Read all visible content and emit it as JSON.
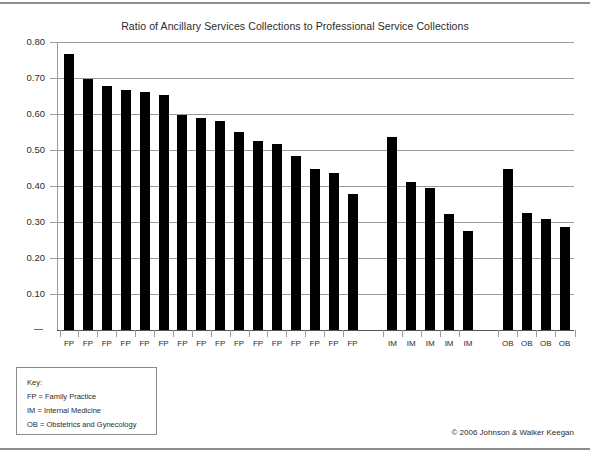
{
  "chart_data": {
    "type": "bar",
    "title": "Ratio of Ancillary Services Collections to Professional Service Collections",
    "xlabel": "",
    "ylabel": "",
    "ylim": [
      0,
      0.8
    ],
    "ytick_labels": [
      "0.80",
      "0.70",
      "0.60",
      "0.50",
      "0.40",
      "0.30",
      "0.20",
      "0.10",
      "–"
    ],
    "ytick_values": [
      0.8,
      0.7,
      0.6,
      0.5,
      0.4,
      0.3,
      0.2,
      0.1,
      0
    ],
    "grid": true,
    "legend_position": "below-left",
    "groups": [
      {
        "code": "FP",
        "name": "Family Practice"
      },
      {
        "code": "IM",
        "name": "Internal Medicine"
      },
      {
        "code": "OB",
        "name": "Obstetrics and Gynecology"
      }
    ],
    "categories": [
      "FP",
      "FP",
      "FP",
      "FP",
      "FP",
      "FP",
      "FP",
      "FP",
      "FP",
      "FP",
      "FP",
      "FP",
      "FP",
      "FP",
      "FP",
      "FP",
      "IM",
      "IM",
      "IM",
      "IM",
      "IM",
      "OB",
      "OB",
      "OB",
      "OB"
    ],
    "values": [
      0.767,
      0.698,
      0.678,
      0.666,
      0.661,
      0.654,
      0.598,
      0.589,
      0.581,
      0.549,
      0.525,
      0.516,
      0.483,
      0.448,
      0.435,
      0.379,
      0.536,
      0.412,
      0.394,
      0.322,
      0.274,
      0.447,
      0.324,
      0.309,
      0.285
    ],
    "series": [
      {
        "name": "Ratio of ancillary services collections to professional service collections",
        "values": [
          0.767,
          0.698,
          0.678,
          0.666,
          0.661,
          0.654,
          0.598,
          0.589,
          0.581,
          0.549,
          0.525,
          0.516,
          0.483,
          0.448,
          0.435,
          0.379,
          0.536,
          0.412,
          0.394,
          0.322,
          0.274,
          0.447,
          0.324,
          0.309,
          0.285
        ]
      }
    ],
    "bar_color": "#000000",
    "grid_color": "#9a9a9a"
  },
  "legend": {
    "key_label": "Key:",
    "entries": [
      "FP = Family Practice",
      "IM = Internal Medicine",
      "OB = Obstetrics and Gynecology"
    ]
  },
  "footer": {
    "copyright": "© 2006 Johnson & Walker Keegan"
  }
}
